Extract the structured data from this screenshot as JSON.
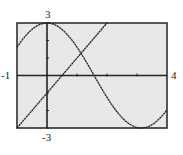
{
  "chart_data": {
    "type": "line",
    "title": "",
    "xlabel": "",
    "ylabel": "",
    "xlim": [
      -1,
      4
    ],
    "ylim": [
      -3,
      3
    ],
    "xticks": [
      0,
      1,
      2,
      3
    ],
    "yticks": [
      -3,
      -2,
      -1,
      0,
      1,
      2,
      3
    ],
    "grid": false,
    "legend": null,
    "window_labels": {
      "xmin": "-1",
      "xmax": "4",
      "ymin": "-3",
      "ymax": "3"
    },
    "series": [
      {
        "name": "y = 3cos(x)",
        "x": [
          -1,
          -0.5,
          0,
          0.5,
          1,
          1.5,
          2,
          2.5,
          3,
          3.5,
          4
        ],
        "values": [
          1.62,
          2.63,
          3.0,
          2.63,
          1.62,
          0.21,
          -1.25,
          -2.4,
          -2.97,
          -2.81,
          -1.96
        ]
      },
      {
        "name": "y = 2x - 1",
        "x": [
          -1,
          0,
          1,
          2
        ],
        "values": [
          -3,
          -1,
          1,
          3
        ]
      }
    ],
    "colors": {
      "background": "#e8e8e8",
      "frame": "#222222",
      "curve": "#222222"
    }
  }
}
